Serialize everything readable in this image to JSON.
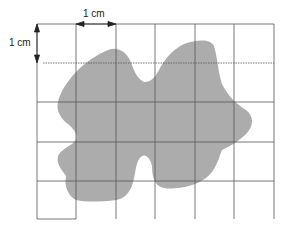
{
  "diagram": {
    "title": "",
    "labels": {
      "horizontal_scale": "1 cm",
      "vertical_scale": "1 cm"
    },
    "grid": {
      "columns": 6,
      "rows": 5,
      "cell_size_label": "1 cm",
      "line_color": "#555555"
    },
    "shape": {
      "description": "irregular leaf-like shaded area",
      "fill_color": "#a9a9a9"
    }
  }
}
